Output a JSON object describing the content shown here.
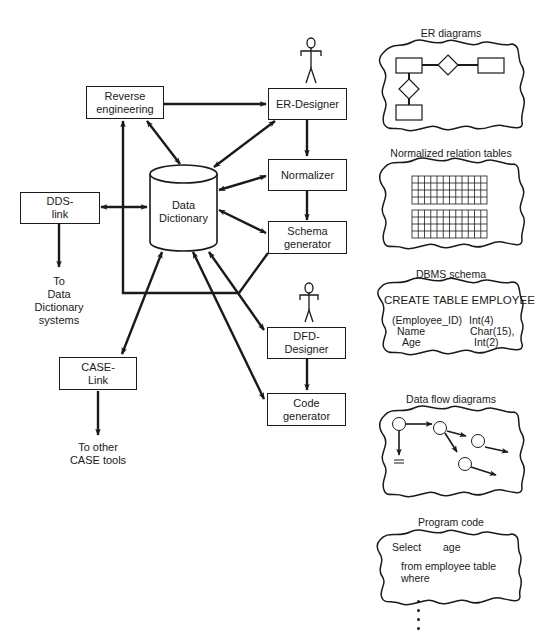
{
  "diagram": {
    "components": {
      "reverse_engineering": {
        "line1": "Reverse",
        "line2": "engineering"
      },
      "er_designer": {
        "line1": "ER-Designer"
      },
      "normalizer": {
        "line1": "Normalizer"
      },
      "schema_generator": {
        "line1": "Schema",
        "line2": "generator"
      },
      "dfd_designer": {
        "line1": "DFD-",
        "line2": "Designer"
      },
      "code_generator": {
        "line1": "Code",
        "line2": "generator"
      },
      "dds_link": {
        "line1": "DDS-",
        "line2": "link"
      },
      "case_link": {
        "line1": "CASE-",
        "line2": "Link"
      },
      "data_dictionary": {
        "line1": "Data",
        "line2": "Dictionary"
      }
    },
    "external_targets": {
      "dds": {
        "line1": "To",
        "line2": "Data",
        "line3": "Dictionary",
        "line4": "systems"
      },
      "case": {
        "line1": "To other",
        "line2": "CASE tools"
      }
    },
    "actors": [
      "er-designer-user",
      "dfd-designer-user"
    ],
    "outputs": {
      "er_diagrams": {
        "title": "ER diagrams"
      },
      "normalized_tables": {
        "title": "Normalized relation tables"
      },
      "dbms_schema": {
        "title": "DBMS schema",
        "header": "CREATE TABLE EMPLOYEE",
        "rows": [
          {
            "col": "(Employee_ID)",
            "type": "Int(4)"
          },
          {
            "col": "Name",
            "type": "Char(15),"
          },
          {
            "col": "Age",
            "type": "Int(2)"
          }
        ]
      },
      "data_flow_diagrams": {
        "title": "Data flow diagrams"
      },
      "program_code": {
        "title": "Program code",
        "line1_kw": "Select",
        "line1_val": "age",
        "line2": "from employee table",
        "line3": "where"
      },
      "continuation": "⋮"
    },
    "connections": [
      {
        "from": "Reverse engineering",
        "to": "ER-Designer",
        "type": "one-way"
      },
      {
        "from": "Reverse engineering",
        "to": "Data Dictionary",
        "type": "two-way"
      },
      {
        "from": "ER-Designer",
        "to": "Data Dictionary",
        "type": "two-way"
      },
      {
        "from": "ER-Designer",
        "to": "Normalizer",
        "type": "one-way"
      },
      {
        "from": "Normalizer",
        "to": "Data Dictionary",
        "type": "two-way"
      },
      {
        "from": "Normalizer",
        "to": "Schema generator",
        "type": "one-way"
      },
      {
        "from": "Schema generator",
        "to": "Data Dictionary",
        "type": "two-way"
      },
      {
        "from": "Schema generator",
        "to": "Reverse engineering",
        "type": "one-way"
      },
      {
        "from": "DDS-link",
        "to": "Data Dictionary",
        "type": "two-way"
      },
      {
        "from": "DDS-link",
        "to": "To Data Dictionary systems",
        "type": "one-way"
      },
      {
        "from": "CASE-Link",
        "to": "Data Dictionary",
        "type": "two-way"
      },
      {
        "from": "CASE-Link",
        "to": "To other CASE tools",
        "type": "one-way"
      },
      {
        "from": "DFD-Designer",
        "to": "Data Dictionary",
        "type": "two-way"
      },
      {
        "from": "DFD-Designer",
        "to": "Code generator",
        "type": "one-way"
      },
      {
        "from": "Code generator",
        "to": "Data Dictionary",
        "type": "two-way"
      }
    ]
  }
}
